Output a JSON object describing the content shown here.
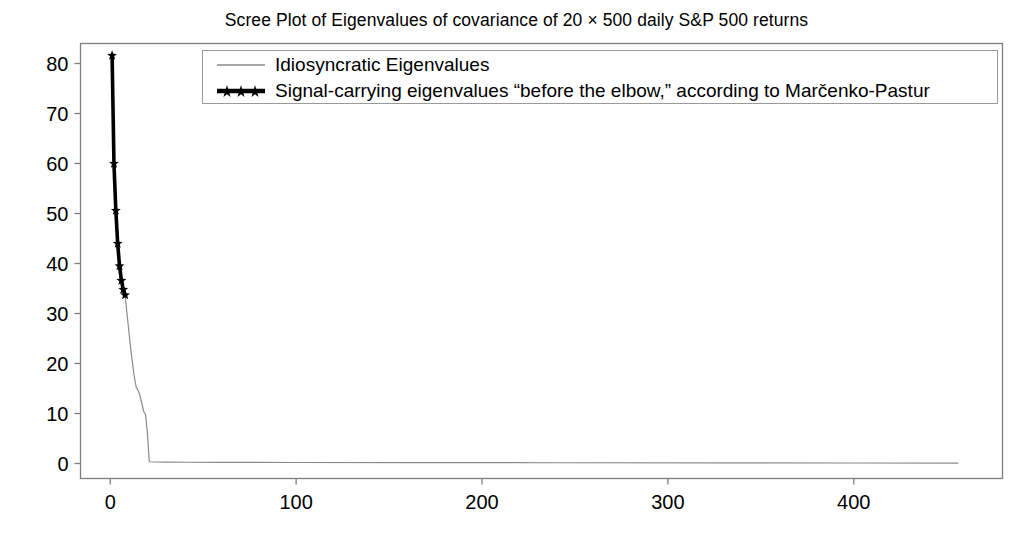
{
  "chart_data": {
    "type": "line",
    "title": "Scree Plot of Eigenvalues of covariance of 20 × 500 daily S&P 500 returns",
    "xlabel": "",
    "ylabel": "",
    "xlim": [
      -16,
      480
    ],
    "ylim": [
      -3,
      84
    ],
    "grid": false,
    "legend_position": "upper center",
    "xticks": [
      0,
      100,
      200,
      300,
      400
    ],
    "xtick_labels": [
      "0",
      "100",
      "200",
      "300",
      "400"
    ],
    "yticks": [
      0,
      10,
      20,
      30,
      40,
      50,
      60,
      70,
      80
    ],
    "ytick_labels": [
      "0",
      "10",
      "20",
      "30",
      "40",
      "50",
      "60",
      "70",
      "80"
    ],
    "series": [
      {
        "name": "Idiosyncratic Eigenvalues",
        "color": "#8a8a8a",
        "linewidth": 1.2,
        "marker": "none",
        "x": [
          1,
          2,
          3,
          4,
          5,
          6,
          7,
          8,
          9,
          10,
          11,
          12,
          13,
          14,
          15,
          16,
          17,
          18,
          19,
          20,
          21,
          24,
          30,
          40,
          60,
          100,
          160,
          240,
          330,
          400,
          456
        ],
        "y": [
          81.6,
          60.0,
          50.6,
          44.0,
          39.5,
          36.6,
          34.8,
          33.7,
          30.0,
          26.5,
          23.0,
          20.0,
          17.2,
          15.2,
          14.6,
          13.6,
          12.0,
          10.4,
          9.8,
          6.0,
          0.35,
          0.3,
          0.28,
          0.25,
          0.22,
          0.2,
          0.18,
          0.15,
          0.12,
          0.1,
          0.08
        ]
      },
      {
        "name": "Signal-carrying eigenvalues “before the elbow,” according to Marčenko-Pastur",
        "color": "#000000",
        "linewidth": 3.6,
        "marker": "star",
        "x": [
          1,
          2,
          3,
          4,
          5,
          6,
          7,
          8
        ],
        "y": [
          81.6,
          60.0,
          50.6,
          44.0,
          39.5,
          36.6,
          34.8,
          33.7
        ]
      }
    ],
    "annotations": []
  },
  "legend": {
    "entries": [
      {
        "label": "Idiosyncratic Eigenvalues",
        "marker": "thin-gray-line",
        "color": "#8a8a8a"
      },
      {
        "label": "Signal-carrying eigenvalues “before the elbow,” according to Marčenko-Pastur",
        "marker": "thick-black-line-with-stars",
        "color": "#000000"
      }
    ]
  },
  "axes": {
    "frame_color": "#7d7d7d",
    "tick_color": "#7d7d7d"
  }
}
